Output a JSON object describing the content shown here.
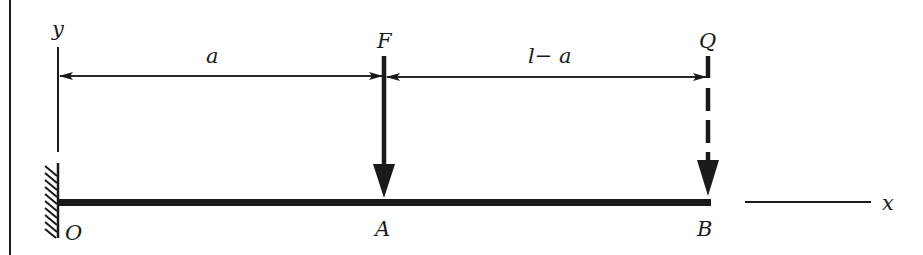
{
  "diagram": {
    "type": "cantilever-beam",
    "colors": {
      "ink": "#1a1a1a",
      "background": "#ffffff"
    },
    "labels": {
      "y_axis": "y",
      "x_axis": "x",
      "origin": "O",
      "point_a": "A",
      "point_b": "B",
      "force_f": "F",
      "force_q": "Q",
      "dim_a": "a",
      "dim_l_minus_a": "l− a"
    },
    "elements": [
      {
        "id": "fixed-support",
        "description": "hatched wall at O (left end)"
      },
      {
        "id": "beam",
        "description": "thick horizontal beam from O to B"
      },
      {
        "id": "force-F",
        "description": "solid downward arrow at A"
      },
      {
        "id": "force-Q",
        "description": "dashed downward arrow at B"
      },
      {
        "id": "dimension-a",
        "description": "dimension line O to A"
      },
      {
        "id": "dimension-l-minus-a",
        "description": "dimension line A to B"
      },
      {
        "id": "y-axis",
        "description": "vertical axis at O"
      },
      {
        "id": "x-axis",
        "description": "horizontal axis to the right of B"
      }
    ]
  }
}
